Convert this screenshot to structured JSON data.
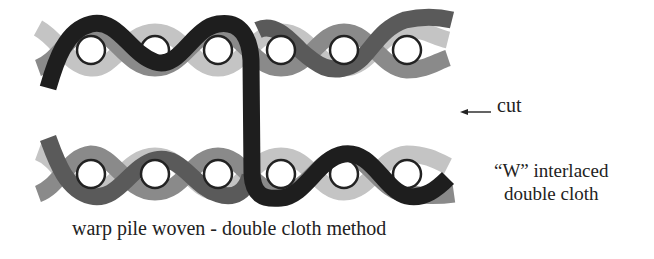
{
  "diagram": {
    "title": "warp pile woven - double cloth method",
    "labels": {
      "cut": "cut",
      "interlace_line1": "“W” interlaced",
      "interlace_line2": "double cloth",
      "caption": "warp pile woven - double cloth method"
    },
    "colors": {
      "pile_yarn": "#1e1e1e",
      "ground_warp_dark": "#5a5a5a",
      "ground_warp_medium": "#8a8a8a",
      "ground_warp_light": "#c4c4c4",
      "weft_fill": "#ffffff",
      "weft_outline": "#222222"
    },
    "upper_cloth": {
      "weft_count": 6,
      "weft_centers_x": [
        91,
        155,
        218,
        281,
        344,
        407
      ],
      "weft_center_y": 50
    },
    "lower_cloth": {
      "weft_count": 6,
      "weft_centers_x": [
        91,
        155,
        218,
        281,
        344,
        407
      ],
      "weft_center_y": 174
    },
    "pile_link": {
      "x": 252,
      "from_y": 50,
      "to_y": 174
    },
    "icons": {
      "cut_arrow": "arrow-left-icon"
    }
  }
}
